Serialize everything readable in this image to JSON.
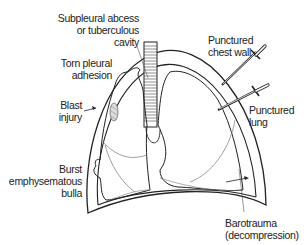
{
  "diagram": {
    "colors": {
      "ink": "#222222",
      "thin": "#666666",
      "background": "#ffffff"
    },
    "labels": {
      "subpleural": "Subpleural abcess\nor tuberculous\ncavity",
      "torn_adhesion": "Torn pleural\nadhesion",
      "blast_injury": "Blast\ninjury",
      "burst_bulla": "Burst\nemphysematous\nbulla",
      "punctured_chest_wall": "Punctured\nchest wall",
      "punctured_lung": "Punctured\nlung",
      "barotrauma": "Barotrauma\n(decompression)"
    },
    "icons": [
      "dagger-icon",
      "dagger-icon",
      "arrow-icon",
      "arrow-icon"
    ]
  }
}
